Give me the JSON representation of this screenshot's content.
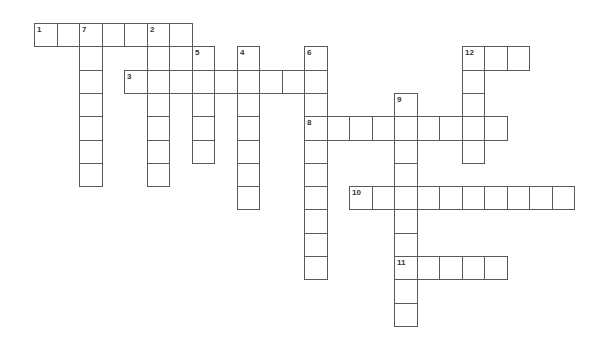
{
  "puzzle": {
    "grid": {
      "origin_x": 34,
      "origin_y": 23,
      "cell_width": 22.5,
      "cell_height": 23.3,
      "border_color": "#5a5a5a",
      "number_color": "#333333"
    },
    "entries": [
      {
        "number": "1",
        "direction": "across",
        "col": 0,
        "row": 0,
        "length": 7
      },
      {
        "number": "2",
        "direction": "down",
        "col": 5,
        "row": 0,
        "length": 7
      },
      {
        "number": "3",
        "direction": "across",
        "col": 4,
        "row": 2,
        "length": 9
      },
      {
        "number": "4",
        "direction": "down",
        "col": 9,
        "row": 1,
        "length": 7
      },
      {
        "number": "5",
        "direction": "down",
        "col": 7,
        "row": 1,
        "length": 5
      },
      {
        "number": "6",
        "direction": "down",
        "col": 12,
        "row": 1,
        "length": 10
      },
      {
        "number": "7",
        "direction": "down",
        "col": 2,
        "row": 0,
        "length": 7
      },
      {
        "number": "8",
        "direction": "across",
        "col": 12,
        "row": 4,
        "length": 9
      },
      {
        "number": "9",
        "direction": "down",
        "col": 16,
        "row": 3,
        "length": 10
      },
      {
        "number": "10",
        "direction": "across",
        "col": 14,
        "row": 7,
        "length": 10
      },
      {
        "number": "11",
        "direction": "across",
        "col": 16,
        "row": 10,
        "length": 5
      },
      {
        "number": "12",
        "direction": "across",
        "col": 19,
        "row": 1,
        "length": 3
      },
      {
        "number": "12",
        "direction": "down",
        "col": 19,
        "row": 1,
        "length": 5
      }
    ]
  }
}
